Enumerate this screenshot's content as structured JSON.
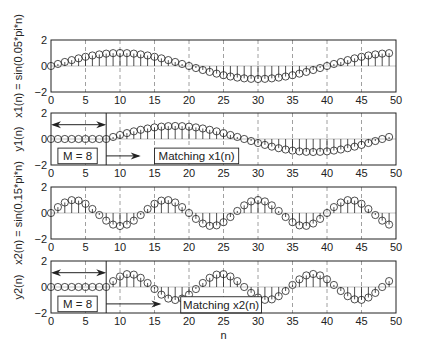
{
  "chart_data": [
    {
      "type": "stem",
      "ylabel": "x1(n) = sin(0.05*pi*n)",
      "xlim": [
        0,
        50
      ],
      "ylim": [
        -2,
        2
      ],
      "xticks": [
        0,
        5,
        10,
        15,
        20,
        25,
        30,
        35,
        40,
        45,
        50
      ],
      "yticks": [
        -2,
        0,
        2
      ],
      "grid": "vertical dashed",
      "formula": {
        "kind": "sin",
        "freq": 0.05,
        "delay": 0
      },
      "n": [
        0,
        1,
        2,
        3,
        4,
        5,
        6,
        7,
        8,
        9,
        10,
        11,
        12,
        13,
        14,
        15,
        16,
        17,
        18,
        19,
        20,
        21,
        22,
        23,
        24,
        25,
        26,
        27,
        28,
        29,
        30,
        31,
        32,
        33,
        34,
        35,
        36,
        37,
        38,
        39,
        40,
        41,
        42,
        43,
        44,
        45,
        46,
        47,
        48,
        49
      ]
    },
    {
      "type": "stem",
      "ylabel": "y1(n)",
      "xlim": [
        0,
        50
      ],
      "ylim": [
        -2,
        2
      ],
      "xticks": [
        0,
        5,
        10,
        15,
        20,
        25,
        30,
        35,
        40,
        45,
        50
      ],
      "yticks": [
        -2,
        0,
        2
      ],
      "grid": "vertical dashed",
      "formula": {
        "kind": "sin",
        "freq": 0.05,
        "delay": 8
      },
      "annotations": [
        {
          "type": "double-arrow",
          "from": 0,
          "to": 8,
          "y": 1.1
        },
        {
          "type": "vline",
          "x": 8
        },
        {
          "type": "box",
          "text": "M = 8",
          "x0": 1,
          "x1": 6.7,
          "y0": -1.9,
          "y1": -0.7
        },
        {
          "type": "arrow",
          "from": 8,
          "to": 13,
          "y": -1.3
        },
        {
          "type": "box",
          "text": "Matching x1(n)",
          "x0": 15,
          "x1": 27.2,
          "y0": -1.9,
          "y1": -0.7
        }
      ]
    },
    {
      "type": "stem",
      "ylabel": "x2(n) = sin(0.15*pi*n)",
      "xlim": [
        0,
        50
      ],
      "ylim": [
        -2,
        2
      ],
      "xticks": [
        0,
        5,
        10,
        15,
        20,
        25,
        30,
        35,
        40,
        45,
        50
      ],
      "yticks": [
        -2,
        0,
        2
      ],
      "grid": "vertical dashed",
      "formula": {
        "kind": "sin",
        "freq": 0.15,
        "delay": 0
      }
    },
    {
      "type": "stem",
      "ylabel": "y2(n)",
      "xlabel": "n",
      "xlim": [
        0,
        50
      ],
      "ylim": [
        -2,
        2
      ],
      "xticks": [
        0,
        5,
        10,
        15,
        20,
        25,
        30,
        35,
        40,
        45,
        50
      ],
      "yticks": [
        -2,
        0,
        2
      ],
      "grid": "vertical dashed",
      "formula": {
        "kind": "sin",
        "freq": 0.15,
        "delay": 8
      },
      "annotations": [
        {
          "type": "double-arrow",
          "from": 0,
          "to": 8,
          "y": 1.1
        },
        {
          "type": "vline",
          "x": 8
        },
        {
          "type": "box",
          "text": "M = 8",
          "x0": 1,
          "x1": 6.7,
          "y0": -1.9,
          "y1": -0.7
        },
        {
          "type": "arrow",
          "from": 8,
          "to": 16,
          "y": -1.3
        },
        {
          "type": "box",
          "text": "Matching x2(n)",
          "x0": 18.8,
          "x1": 30.5,
          "y0": -2,
          "y1": -0.75
        }
      ]
    }
  ],
  "labels": {
    "p1_ylabel": "x1(n) = sin(0.05*pi*n)",
    "p2_ylabel": "y1(n)",
    "p3_ylabel": "x2(n) = sin(0.15*pi*n)",
    "p4_ylabel": "y2(n)",
    "xlabel": "n",
    "m_box": "M = 8",
    "match1": "Matching x1(n)",
    "match2": "Matching x2(n)"
  }
}
